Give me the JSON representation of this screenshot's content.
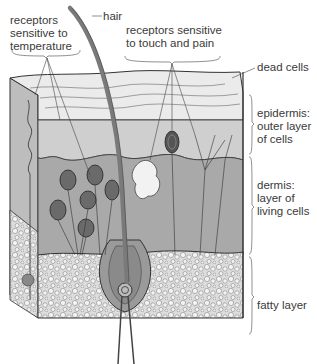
{
  "labels": {
    "temperature_receptors": "receptors\nsensitive to\ntemperature",
    "hair": "hair",
    "touch_pain_receptors": "receptors sensitive\nto touch and pain",
    "dead_cells": "dead cells",
    "epidermis": "epidermis:\nouter layer\nof cells",
    "dermis": "dermis:\nlayer of\nliving cells",
    "fatty_layer": "fatty layer"
  },
  "colors": {
    "dead_cells_layer": "#e6e6e6",
    "epidermis_layer": "#cfcfcf",
    "dermis_layer": "#a9a9a9",
    "fatty_layer": "#d9d9d9",
    "hair": "#7a7a7a",
    "line": "#3a3a3a",
    "text": "#3a3a3a"
  }
}
